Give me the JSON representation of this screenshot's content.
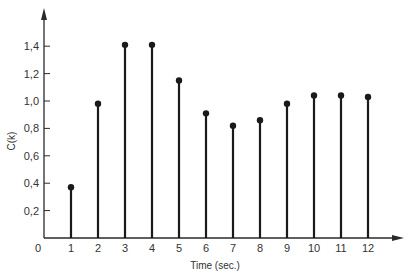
{
  "chart_data": {
    "type": "stem",
    "title": "",
    "xlabel": "Time (sec.)",
    "ylabel": "C(k)",
    "x": [
      1,
      2,
      3,
      4,
      5,
      6,
      7,
      8,
      9,
      10,
      11,
      12
    ],
    "values": [
      0.37,
      0.98,
      1.41,
      1.41,
      1.15,
      0.91,
      0.82,
      0.86,
      0.98,
      1.04,
      1.04,
      1.03
    ],
    "x_ticks": [
      "1",
      "2",
      "3",
      "4",
      "5",
      "6",
      "7",
      "8",
      "9",
      "10",
      "11",
      "12"
    ],
    "y_ticks": [
      "0,2",
      "0,4",
      "0,6",
      "0,8",
      "1,0",
      "1,2",
      "1,4"
    ],
    "origin_label": "0",
    "xlim": [
      0,
      13
    ],
    "ylim": [
      0,
      1.6
    ],
    "grid": false,
    "legend": null,
    "colors": {
      "stem": "#1a1a1a",
      "axis": "#2a2a2a",
      "text": "#333333"
    }
  }
}
